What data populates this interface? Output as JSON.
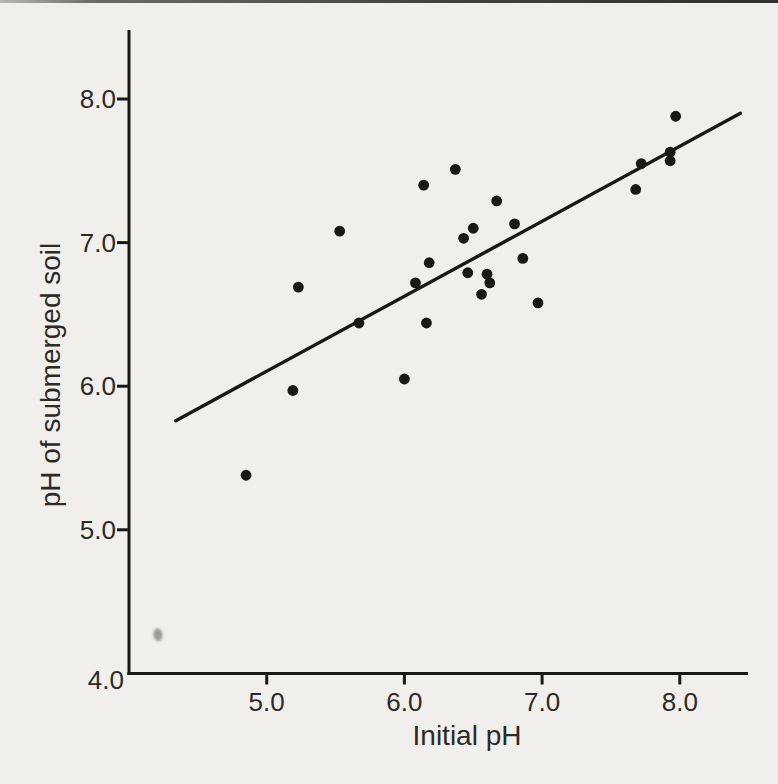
{
  "page": {
    "background_color": "#f1efeb",
    "description_colors": {
      "ink": "#181816",
      "text": "#2b2a27",
      "smudge": "#8f8f8b"
    }
  },
  "chart_data": {
    "type": "scatter",
    "title": "",
    "xlabel": "Initial pH",
    "ylabel": "pH of submerged soil",
    "xlim": [
      4.0,
      8.5
    ],
    "ylim": [
      4.0,
      8.5
    ],
    "grid": false,
    "legend": null,
    "x_ticks": {
      "values": [
        5.0,
        6.0,
        7.0,
        8.0
      ],
      "labels": [
        "5.0",
        "6.0",
        "7.0",
        "8.0"
      ]
    },
    "y_ticks": {
      "values": [
        8.0,
        7.0,
        6.0,
        5.0,
        4.0
      ],
      "labels": [
        "8.0",
        "7.0",
        "6.0",
        "5.0",
        "4.0"
      ]
    },
    "points": [
      [
        4.85,
        5.38
      ],
      [
        5.19,
        5.97
      ],
      [
        5.23,
        6.69
      ],
      [
        5.53,
        7.08
      ],
      [
        5.67,
        6.44
      ],
      [
        6.0,
        6.05
      ],
      [
        6.08,
        6.72
      ],
      [
        6.14,
        7.4
      ],
      [
        6.16,
        6.44
      ],
      [
        6.18,
        6.86
      ],
      [
        6.37,
        7.51
      ],
      [
        6.43,
        7.03
      ],
      [
        6.46,
        6.79
      ],
      [
        6.5,
        7.1
      ],
      [
        6.56,
        6.64
      ],
      [
        6.6,
        6.78
      ],
      [
        6.62,
        6.72
      ],
      [
        6.67,
        7.29
      ],
      [
        6.8,
        7.13
      ],
      [
        6.86,
        6.89
      ],
      [
        6.97,
        6.58
      ],
      [
        7.68,
        7.37
      ],
      [
        7.72,
        7.55
      ],
      [
        7.93,
        7.63
      ],
      [
        7.93,
        7.57
      ],
      [
        7.97,
        7.88
      ]
    ],
    "regression_line": {
      "x1": 4.34,
      "y1": 5.76,
      "x2": 8.44,
      "y2": 7.9
    },
    "scan_artifact_smudge": {
      "x": 4.21,
      "y": 4.27
    }
  }
}
